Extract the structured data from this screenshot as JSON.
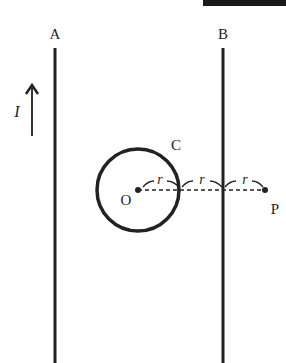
{
  "diagram": {
    "wires": [
      {
        "label": "A",
        "x": 55
      },
      {
        "label": "B",
        "x": 223
      }
    ],
    "current_label": "I",
    "loop_label": "C",
    "center_label": "O",
    "point_label": "P",
    "spacing_labels": [
      "r",
      "r",
      "r"
    ],
    "header_fragment": "▇▇▇▇▇",
    "colors": {
      "line": "#222222",
      "background": "#ffffff"
    }
  }
}
